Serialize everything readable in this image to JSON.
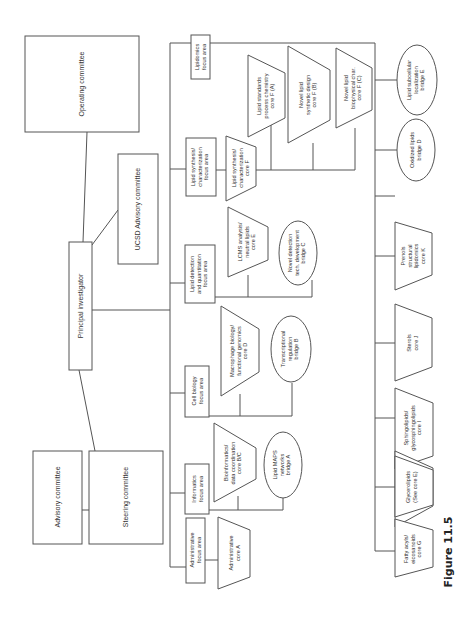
{
  "figure": {
    "caption": "Figure 11.5",
    "orientation": "rotated 90° counter-clockwise"
  },
  "governance": {
    "operating_committee": "Operating committee",
    "principal_investigator": "Principal investigator",
    "ucsd_advisory_committee": "UCSD Advisory committee",
    "advisory_committee": "Advisory committee",
    "steering_committee": "Steering committee"
  },
  "focus_areas": [
    {
      "id": "administrative",
      "lines": [
        "Administrative",
        "focus area"
      ]
    },
    {
      "id": "informatics",
      "lines": [
        "Informatics",
        "focus area"
      ]
    },
    {
      "id": "cell_biology",
      "lines": [
        "Cell biology",
        "focus area"
      ]
    },
    {
      "id": "lipid_detection",
      "lines": [
        "Lipid detection",
        "and quantitation",
        "focus area"
      ]
    },
    {
      "id": "lipid_synthesis",
      "lines": [
        "Lipid synthesis/",
        "characterization",
        "focus area"
      ]
    },
    {
      "id": "lipidomics",
      "lines": [
        "Lipidomics",
        "focus area"
      ]
    }
  ],
  "cores": {
    "administrative_core_a": [
      "Administrative",
      "core A"
    ],
    "bioinformatics_core_bc": [
      "Bioinformatics/",
      "data coordination",
      "core B/C"
    ],
    "macrophage_core_d": [
      "Macrophage biology/",
      "functional genomics",
      "core D"
    ],
    "lcms_core_e": [
      "LCMS analysis/",
      "neutral lipids",
      "core E"
    ],
    "lipid_synthesis_core_f": [
      "Lipid synthesis/",
      "characterization",
      "core F"
    ],
    "lipid_standards_core_fa": [
      "Lipid standards",
      "process chemistry",
      "core F (A)"
    ],
    "novel_synthetic_core_fb": [
      "Novel lipid",
      "synthetic design",
      "core F (B)"
    ],
    "novel_biophysical_core_fc": [
      "Novel lipid",
      "biophysical char.",
      "core F (C)"
    ],
    "fatty_acyls_core_g": [
      "Fatty acyls/",
      "eicosanoids",
      "core G"
    ],
    "glycerolipids": [
      "Glycerolipids",
      "(See core E)"
    ],
    "glycerophospholipids_core_h": [
      "Glycero-",
      "phospholipids",
      "core H"
    ],
    "sphingolipids_core_i": [
      "Sphingolipids/",
      "glycosphingolipids",
      "core I"
    ],
    "sterols_core_j": [
      "Sterols",
      "core J"
    ],
    "prenols_core_k": [
      "Prenols",
      "structural",
      "lipidomics",
      "core K"
    ]
  },
  "bridges": {
    "lipid_maps_bridge_a": [
      "Lipid MAPS",
      "networks",
      "bridge A"
    ],
    "transcriptional_bridge_b": [
      "Transcriptional",
      "regulation",
      "bridge B"
    ],
    "novel_detection_bridge_c": [
      "Novel detection",
      "tech. development",
      "bridge C"
    ],
    "oxidized_lipids_bridge_d": [
      "Oxidized lipids",
      "bridge D"
    ],
    "subcellular_bridge_e": [
      "Lipid subcellular",
      "localization",
      "bridge E"
    ]
  }
}
